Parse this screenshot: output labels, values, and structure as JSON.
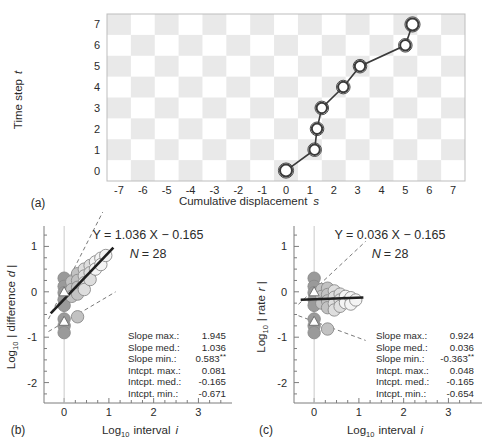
{
  "figure": {
    "panels": [
      "(a)",
      "(b)",
      "(c)"
    ]
  },
  "panel_a": {
    "label": "(a)",
    "xlabel_main": "Cumulative displacement",
    "xlabel_sym": "s",
    "ylabel_main": "Time step",
    "ylabel_sym": "t",
    "xticks": [
      "-7",
      "-6",
      "-5",
      "-4",
      "-3",
      "-2",
      "-1",
      "0",
      "1",
      "2",
      "3",
      "4",
      "5",
      "6",
      "7"
    ],
    "yticks": [
      "0",
      "1",
      "2",
      "3",
      "4",
      "5",
      "6",
      "7"
    ],
    "grid": "checkerboard",
    "grid_fill": "#e9e9e9",
    "marker_edge": "#3a3a3a",
    "line_color": "#3a3a3a"
  },
  "panel_b": {
    "label": "(b)",
    "equation": "Y = 1.036 X − 0.165",
    "n_label": "N",
    "n_value": "= 28",
    "xlabel_pre": "Log",
    "xlabel_sub": "10",
    "xlabel_post": "interval",
    "xlabel_sym": "i",
    "ylabel_pre": "Log",
    "ylabel_sub": "10",
    "ylabel_post": "| difference",
    "ylabel_sym": "d",
    "ylabel_end": "|",
    "xticks": [
      "0",
      "1",
      "2",
      "3"
    ],
    "yticks": [
      "1",
      "0",
      "-1",
      "-2"
    ],
    "stats": [
      {
        "name": "Slope max.:",
        "value": "1.945",
        "sig": ""
      },
      {
        "name": "Slope med.:",
        "value": "1.036",
        "sig": ""
      },
      {
        "name": "Slope min.:",
        "value": "0.583",
        "sig": "**"
      },
      {
        "name": "Intcpt. max.:",
        "value": "0.081",
        "sig": ""
      },
      {
        "name": "Intcpt. med.:",
        "value": "-0.165",
        "sig": ""
      },
      {
        "name": "Intcpt. min.:",
        "value": "-0.671",
        "sig": ""
      }
    ]
  },
  "panel_c": {
    "label": "(c)",
    "equation": "Y = 0.036 X − 0.165",
    "n_label": "N",
    "n_value": "= 28",
    "xlabel_pre": "Log",
    "xlabel_sub": "10",
    "xlabel_post": "interval",
    "xlabel_sym": "i",
    "ylabel_pre": "Log",
    "ylabel_sub": "10",
    "ylabel_post": "| rate",
    "ylabel_sym": "r",
    "ylabel_end": "|",
    "xticks": [
      "0",
      "1",
      "2",
      "3"
    ],
    "yticks": [
      "1",
      "0",
      "-1",
      "-2"
    ],
    "stats": [
      {
        "name": "Slope max.:",
        "value": "0.924",
        "sig": ""
      },
      {
        "name": "Slope med.:",
        "value": "0.036",
        "sig": ""
      },
      {
        "name": "Slope min.:",
        "value": "-0.363",
        "sig": "**"
      },
      {
        "name": "Intcpt. max.:",
        "value": "0.048",
        "sig": ""
      },
      {
        "name": "Intcpt. med.:",
        "value": "-0.165",
        "sig": ""
      },
      {
        "name": "Intcpt. min.:",
        "value": "-0.654",
        "sig": ""
      }
    ]
  },
  "chart_data": [
    {
      "type": "line",
      "title": "",
      "panel": "(a)",
      "xlabel": "Cumulative displacement s",
      "ylabel": "Time step t",
      "xlim": [
        -7.5,
        7.5
      ],
      "ylim": [
        -0.5,
        7.5
      ],
      "grid": true,
      "x": [
        0,
        1.2,
        1.3,
        1.5,
        2.4,
        3.1,
        5.0,
        5.3
      ],
      "y": [
        0,
        1,
        2,
        3,
        4,
        5,
        6,
        7
      ],
      "series": [
        {
          "name": "random walk trajectory",
          "x": [
            0,
            1.2,
            1.3,
            1.5,
            2.4,
            3.1,
            5.0,
            5.3
          ],
          "values": [
            0,
            1,
            2,
            3,
            4,
            5,
            6,
            7
          ]
        }
      ]
    },
    {
      "type": "scatter",
      "panel": "(b)",
      "title": "Y = 1.036 X − 0.165",
      "xlabel": "Log10 interval i",
      "ylabel": "Log10 | difference d |",
      "xlim": [
        -0.45,
        3.75
      ],
      "ylim": [
        -2.45,
        1.45
      ],
      "grid": false,
      "n": 28,
      "fit": {
        "slope": 1.036,
        "intercept": -0.165,
        "xrange": [
          -0.3,
          1.1
        ]
      },
      "envelope": [
        {
          "name": "max",
          "slope": 1.945,
          "intercept": 0.081
        },
        {
          "name": "min",
          "slope": 0.583,
          "intercept": -0.671
        }
      ],
      "points": [
        {
          "x": 0.0,
          "y": 0.3,
          "shade": "dark"
        },
        {
          "x": 0.0,
          "y": 0.12,
          "shade": "dark"
        },
        {
          "x": 0.0,
          "y": -0.02,
          "shade": "dark"
        },
        {
          "x": 0.0,
          "y": -0.17,
          "shade": "dark"
        },
        {
          "x": 0.0,
          "y": -0.3,
          "shade": "dark"
        },
        {
          "x": 0.0,
          "y": -0.6,
          "shade": "dark"
        },
        {
          "x": 0.0,
          "y": -0.75,
          "shade": "dark"
        },
        {
          "x": 0.0,
          "y": -0.9,
          "shade": "dark"
        },
        {
          "x": 0.17,
          "y": 0.22,
          "shade": "mid"
        },
        {
          "x": 0.17,
          "y": 0.05,
          "shade": "mid"
        },
        {
          "x": 0.17,
          "y": -0.1,
          "shade": "mid"
        },
        {
          "x": 0.3,
          "y": 0.4,
          "shade": "mid"
        },
        {
          "x": 0.3,
          "y": 0.25,
          "shade": "mid"
        },
        {
          "x": 0.3,
          "y": 0.1,
          "shade": "mid"
        },
        {
          "x": 0.3,
          "y": -0.05,
          "shade": "mid"
        },
        {
          "x": 0.3,
          "y": -0.55,
          "shade": "mid"
        },
        {
          "x": 0.45,
          "y": 0.5,
          "shade": "light"
        },
        {
          "x": 0.45,
          "y": 0.35,
          "shade": "light"
        },
        {
          "x": 0.45,
          "y": 0.2,
          "shade": "light"
        },
        {
          "x": 0.45,
          "y": 0.05,
          "shade": "light"
        },
        {
          "x": 0.58,
          "y": 0.58,
          "shade": "light"
        },
        {
          "x": 0.58,
          "y": 0.42,
          "shade": "light"
        },
        {
          "x": 0.58,
          "y": 0.27,
          "shade": "light"
        },
        {
          "x": 0.7,
          "y": 0.66,
          "shade": "vlight"
        },
        {
          "x": 0.7,
          "y": 0.5,
          "shade": "vlight"
        },
        {
          "x": 0.82,
          "y": 0.74,
          "shade": "vlight"
        },
        {
          "x": 0.82,
          "y": 0.6,
          "shade": "vlight"
        },
        {
          "x": 0.93,
          "y": 0.8,
          "shade": "vlight"
        }
      ],
      "medians": [
        {
          "x": 0.0,
          "y": 0.0
        },
        {
          "x": 0.0,
          "y": -0.65
        }
      ]
    },
    {
      "type": "scatter",
      "panel": "(c)",
      "title": "Y = 0.036 X − 0.165",
      "xlabel": "Log10 interval i",
      "ylabel": "Log10 | rate r |",
      "xlim": [
        -0.45,
        3.75
      ],
      "ylim": [
        -2.45,
        1.45
      ],
      "grid": false,
      "n": 28,
      "fit": {
        "slope": 0.036,
        "intercept": -0.165,
        "xrange": [
          -0.3,
          1.1
        ]
      },
      "envelope": [
        {
          "name": "max",
          "slope": 0.924,
          "intercept": 0.048
        },
        {
          "name": "min",
          "slope": -0.363,
          "intercept": -0.654
        }
      ],
      "points": [
        {
          "x": 0.0,
          "y": 0.3,
          "shade": "dark"
        },
        {
          "x": 0.0,
          "y": 0.12,
          "shade": "dark"
        },
        {
          "x": 0.0,
          "y": -0.02,
          "shade": "dark"
        },
        {
          "x": 0.0,
          "y": -0.17,
          "shade": "dark"
        },
        {
          "x": 0.0,
          "y": -0.3,
          "shade": "dark"
        },
        {
          "x": 0.0,
          "y": -0.6,
          "shade": "dark"
        },
        {
          "x": 0.0,
          "y": -0.75,
          "shade": "dark"
        },
        {
          "x": 0.0,
          "y": -0.9,
          "shade": "dark"
        },
        {
          "x": 0.17,
          "y": 0.05,
          "shade": "mid"
        },
        {
          "x": 0.17,
          "y": -0.1,
          "shade": "mid"
        },
        {
          "x": 0.17,
          "y": -0.25,
          "shade": "mid"
        },
        {
          "x": 0.3,
          "y": 0.08,
          "shade": "mid"
        },
        {
          "x": 0.3,
          "y": -0.06,
          "shade": "mid"
        },
        {
          "x": 0.3,
          "y": -0.2,
          "shade": "mid"
        },
        {
          "x": 0.3,
          "y": -0.35,
          "shade": "mid"
        },
        {
          "x": 0.3,
          "y": -0.82,
          "shade": "mid"
        },
        {
          "x": 0.45,
          "y": 0.02,
          "shade": "light"
        },
        {
          "x": 0.45,
          "y": -0.12,
          "shade": "light"
        },
        {
          "x": 0.45,
          "y": -0.26,
          "shade": "light"
        },
        {
          "x": 0.45,
          "y": -0.4,
          "shade": "light"
        },
        {
          "x": 0.58,
          "y": -0.05,
          "shade": "light"
        },
        {
          "x": 0.58,
          "y": -0.18,
          "shade": "light"
        },
        {
          "x": 0.58,
          "y": -0.32,
          "shade": "light"
        },
        {
          "x": 0.7,
          "y": -0.1,
          "shade": "vlight"
        },
        {
          "x": 0.7,
          "y": -0.24,
          "shade": "vlight"
        },
        {
          "x": 0.82,
          "y": -0.13,
          "shade": "vlight"
        },
        {
          "x": 0.82,
          "y": -0.27,
          "shade": "vlight"
        },
        {
          "x": 0.93,
          "y": -0.18,
          "shade": "vlight"
        }
      ],
      "medians": [
        {
          "x": 0.0,
          "y": 0.0
        },
        {
          "x": 0.0,
          "y": -0.65
        }
      ]
    }
  ]
}
